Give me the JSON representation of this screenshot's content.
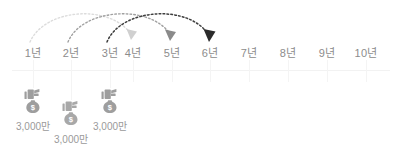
{
  "timeline": {
    "axis_color": "#f2f2f2",
    "label_color": "#8c8c8c",
    "start_x": 33,
    "spacing": 38.5,
    "years": [
      {
        "label": "1년",
        "x": 33
      },
      {
        "label": "2년",
        "x": 71
      },
      {
        "label": "3년",
        "x": 110
      },
      {
        "label": "4년",
        "x": 133
      },
      {
        "label": "5년",
        "x": 172
      },
      {
        "label": "6년",
        "x": 210
      },
      {
        "label": "7년",
        "x": 249
      },
      {
        "label": "8년",
        "x": 288
      },
      {
        "label": "9년",
        "x": 327
      },
      {
        "label": "10년",
        "x": 366
      }
    ]
  },
  "deposits": [
    {
      "id": "deposit-year-1",
      "amount": "3,000만",
      "x": 33,
      "icon_top": 88,
      "label_top": 118,
      "icon_color": "#9e9e9e",
      "icon_name": "money-bag-icon"
    },
    {
      "id": "deposit-year-2",
      "amount": "3,000만",
      "x": 71,
      "icon_top": 100,
      "label_top": 131,
      "icon_color": "#a8a8a8",
      "icon_name": "money-bag-icon"
    },
    {
      "id": "deposit-year-3",
      "amount": "3,000만",
      "x": 110,
      "icon_top": 88,
      "label_top": 118,
      "icon_color": "#9e9e9e",
      "icon_name": "money-bag-icon"
    }
  ],
  "arrows": [
    {
      "id": "maturity-arc-1",
      "from_year": "1년",
      "to_year": "4년",
      "from_x": 33,
      "to_x": 133,
      "color": "#d8d8d8",
      "style": "dotted"
    },
    {
      "id": "maturity-arc-2",
      "from_year": "2년",
      "to_year": "5년",
      "from_x": 71,
      "to_x": 172,
      "color": "#9a9a9a",
      "style": "dotted"
    },
    {
      "id": "maturity-arc-3",
      "from_year": "3년",
      "to_year": "6년",
      "from_x": 110,
      "to_x": 210,
      "color": "#3a3a3a",
      "style": "dotted"
    }
  ]
}
